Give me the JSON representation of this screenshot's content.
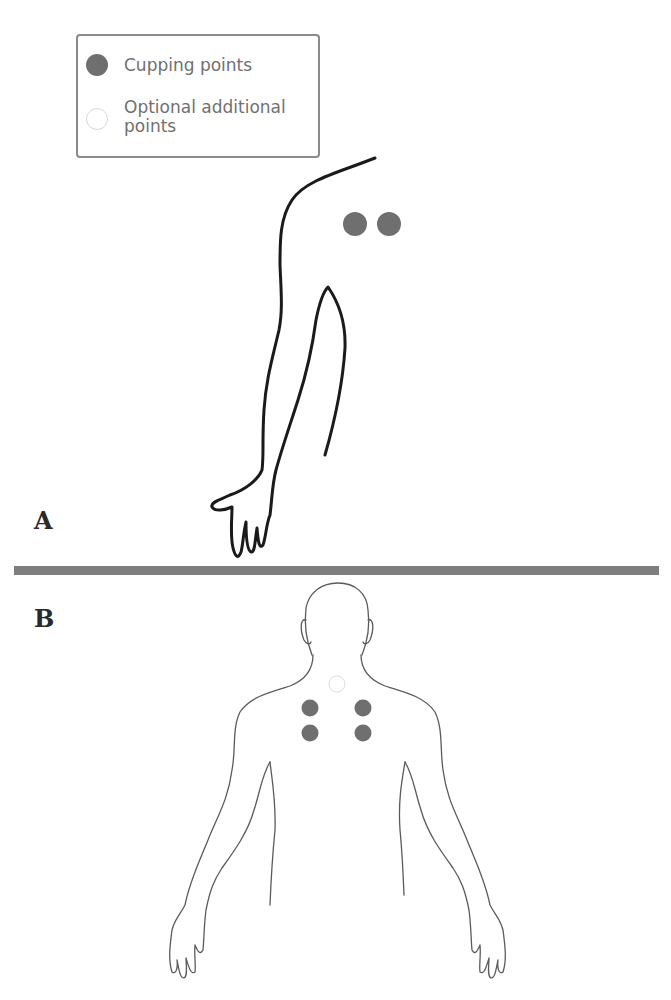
{
  "legend": {
    "items": [
      {
        "label": "Cupping points",
        "marker": "filled-circle",
        "color": "#6f6f6f"
      },
      {
        "label": "Optional additional points",
        "marker": "empty-circle",
        "color": "#ffffff"
      }
    ]
  },
  "panels": [
    {
      "id": "A",
      "label": "A",
      "description": "Side view of arm and shoulder with two cupping points on the shoulder"
    },
    {
      "id": "B",
      "label": "B",
      "description": "Back view of upper body with four cupping points and one optional point at base of neck"
    }
  ],
  "colors": {
    "cupping_point": "#6f6f6f",
    "divider": "#7e7e7e",
    "outline_a": "#1a1a1a",
    "outline_b": "#5a5a5a",
    "legend_border": "#8a8a8a"
  }
}
